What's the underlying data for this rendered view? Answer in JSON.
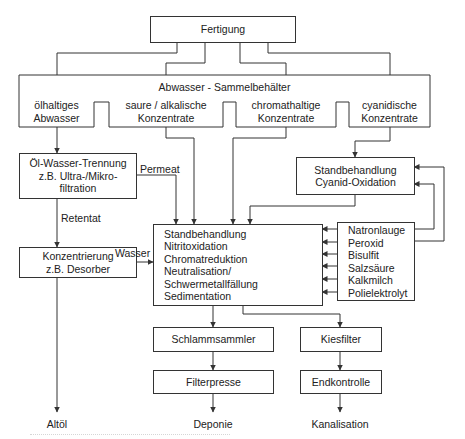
{
  "diagram": {
    "type": "flowchart",
    "nodes": {
      "fertigung": "Fertigung",
      "sammelbehaelter": {
        "title": "Abwasser - Sammelbehälter",
        "compartments": [
          {
            "line1": "ölhaltiges",
            "line2": "Abwasser"
          },
          {
            "line1": "saure / alkalische",
            "line2": "Konzentrate"
          },
          {
            "line1": "chromathaltige",
            "line2": "Konzentrate"
          },
          {
            "line1": "cyanidische",
            "line2": "Konzentrate"
          }
        ]
      },
      "oel_wasser": {
        "line1": "Öl-Wasser-Trennung",
        "line2": "z.B.  Ultra-/Mikro-",
        "line3": "filtration"
      },
      "konzentrierung": {
        "line1": "Konzentrierung",
        "line2": "z.B. Desorber"
      },
      "cyanid": {
        "line1": "Standbehandlung",
        "line2": "Cyanid-Oxidation"
      },
      "haupt": {
        "lines": [
          "Standbehandlung",
          "Nitritoxidation",
          "Chromatreduktion",
          "Neutralisation/",
          "Schwermetallfällung",
          "Sedimentation"
        ]
      },
      "chemikalien": {
        "lines": [
          "Natronlauge",
          "Peroxid",
          "Bisulfit",
          "Salzsäure",
          "Kalkmilch",
          "Polielektrolyt"
        ]
      },
      "schlammsammler": "Schlammsammler",
      "filterpresse": "Filterpresse",
      "kiesfilter": "Kiesfilter",
      "endkontrolle": "Endkontrolle"
    },
    "edge_labels": {
      "permeat": "Permeat",
      "retentat": "Retentat",
      "wasser": "Wasser"
    },
    "outputs": {
      "altoel": "Altöl",
      "deponie": "Deponie",
      "kanalisation": "Kanalisation"
    },
    "colors": {
      "line": "#333333",
      "text": "#222222",
      "background": "#ffffff"
    }
  }
}
